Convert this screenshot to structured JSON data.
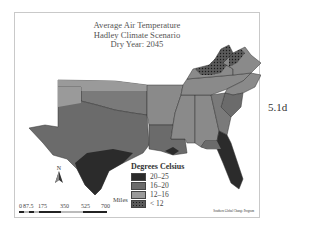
{
  "title": {
    "line1": "Average Air Temperature",
    "line2": "Hadley Climate Scenario",
    "line3": "Dry Year: 2045"
  },
  "figure_label": "5.1d",
  "legend": {
    "title": "Degrees Celsius",
    "items": [
      {
        "label": "20–25",
        "color": "#2b2b2b",
        "pattern": false
      },
      {
        "label": "16–20",
        "color": "#6b6b6b",
        "pattern": false
      },
      {
        "label": "12–16",
        "color": "#9a9a9a",
        "pattern": false
      },
      {
        "label": "< 12",
        "color": "#4a4a4a",
        "pattern": true
      }
    ]
  },
  "north_arrow": {
    "label": "N"
  },
  "scale": {
    "unit": "Miles",
    "ticks": [
      "0",
      "87.5",
      "175",
      "350",
      "525",
      "700"
    ]
  },
  "credit": "Southern Global Change Program",
  "colors": {
    "class_20_25": "#2b2b2b",
    "class_16_20": "#6b6b6b",
    "class_12_16": "#9a9a9a",
    "class_lt12": "#4a4a4a",
    "state_border": "#333333",
    "frame_border": "#c9c9c9"
  }
}
